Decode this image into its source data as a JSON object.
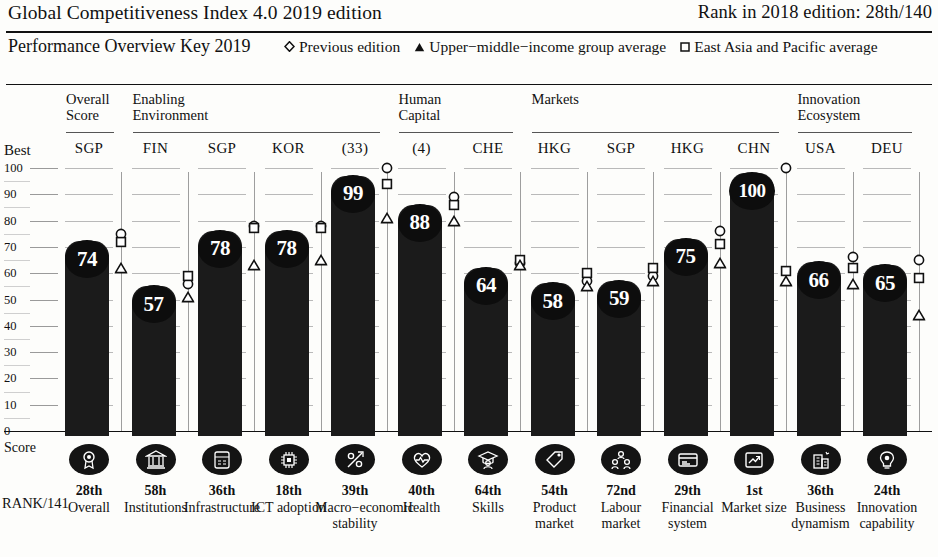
{
  "header": {
    "title": "Global Competitiveness Index 4.0 2019 edition",
    "rank": "Rank in 2018 edition: 28th/140"
  },
  "key": {
    "label": "Performance Overview Key 2019",
    "legend": [
      {
        "symbol": "diamond-marker",
        "label": "Previous edition"
      },
      {
        "symbol": "triangle-marker",
        "label": "Upper−middle−income group average"
      },
      {
        "symbol": "square-marker",
        "label": "East Asia and Pacific average"
      }
    ]
  },
  "axis": {
    "best_label": "Best",
    "score_label": "Score",
    "rank_label": "RANK/141",
    "ticks": [
      "100",
      "90",
      "80",
      "70",
      "60",
      "50",
      "40",
      "30",
      "20",
      "10",
      "0"
    ],
    "min": 0,
    "max": 100
  },
  "groups": [
    {
      "name": "Overall\nScore",
      "line1": "Overall",
      "line2": "Score"
    },
    {
      "name": "Enabling Environment",
      "line1": "Enabling",
      "line2": "Environment"
    },
    {
      "name": "Human Capital",
      "line1": "Human",
      "line2": "Capital"
    },
    {
      "name": "Markets",
      "line1": "Markets",
      "line2": ""
    },
    {
      "name": "Innovation Ecosystem",
      "line1": "Innovation",
      "line2": "Ecosystem"
    }
  ],
  "chart_data": {
    "type": "bar",
    "ylabel": "Score",
    "ylim": [
      0,
      100
    ],
    "grid": true,
    "categories": [
      "Overall",
      "Institutions",
      "Infrastructure",
      "ICT adoption",
      "Macro−economic stability",
      "Health",
      "Skills",
      "Product market",
      "Labour market",
      "Financial system",
      "Market size",
      "Business dynamism",
      "Innovation capability"
    ],
    "values": [
      74,
      57,
      78,
      78,
      99,
      88,
      64,
      58,
      59,
      75,
      100,
      66,
      65
    ],
    "series": [
      {
        "name": "2019 edition",
        "values": [
          74,
          57,
          78,
          78,
          99,
          88,
          64,
          58,
          59,
          75,
          100,
          66,
          65
        ]
      },
      {
        "name": "Previous edition",
        "values": [
          75,
          56,
          78,
          78,
          100,
          89,
          64,
          57,
          59,
          76,
          100,
          66,
          65
        ]
      },
      {
        "name": "East Asia and Pacific average",
        "values": [
          72,
          59,
          75,
          77,
          94,
          86,
          65,
          60,
          62,
          71,
          61,
          62,
          58
        ]
      },
      {
        "name": "Upper−middle−income group average",
        "values": [
          62,
          51,
          63,
          65,
          81,
          80,
          63,
          55,
          57,
          64,
          57,
          56,
          44
        ]
      }
    ],
    "best_economies": [
      "SGP",
      "FIN",
      "SGP",
      "KOR",
      "(33)",
      "(4)",
      "CHE",
      "HKG",
      "SGP",
      "HKG",
      "CHN",
      "USA",
      "DEU"
    ]
  },
  "columns": [
    {
      "code": "SGP",
      "value": 74,
      "prev": 75,
      "eap": 72,
      "umi": 62,
      "rank": "28th",
      "name": "Overall",
      "icon": "award-icon"
    },
    {
      "code": "FIN",
      "value": 57,
      "prev": 56,
      "eap": 59,
      "umi": 51,
      "rank": "58h",
      "name": "Institutions",
      "icon": "institution-icon"
    },
    {
      "code": "SGP",
      "value": 78,
      "prev": 78,
      "eap": 77,
      "umi": 63,
      "rank": "36th",
      "name": "Infrastructure",
      "icon": "infrastructure-icon"
    },
    {
      "code": "KOR",
      "value": 78,
      "prev": 78,
      "eap": 77,
      "umi": 65,
      "rank": "18th",
      "name": "ICT adoption",
      "icon": "chip-icon"
    },
    {
      "code": "(33)",
      "value": 99,
      "prev": 100,
      "eap": 94,
      "umi": 81,
      "rank": "39th",
      "name": "Macro−economic stability",
      "icon": "percent-icon"
    },
    {
      "code": "(4)",
      "value": 88,
      "prev": 89,
      "eap": 86,
      "umi": 80,
      "rank": "40th",
      "name": "Health",
      "icon": "heart-icon"
    },
    {
      "code": "CHE",
      "value": 64,
      "prev": 64,
      "eap": 65,
      "umi": 63,
      "rank": "64th",
      "name": "Skills",
      "icon": "graduate-icon"
    },
    {
      "code": "HKG",
      "value": 58,
      "prev": 57,
      "eap": 60,
      "umi": 55,
      "rank": "54th",
      "name": "Product market",
      "icon": "tag-icon"
    },
    {
      "code": "SGP",
      "value": 59,
      "prev": 59,
      "eap": 62,
      "umi": 57,
      "rank": "72nd",
      "name": "Labour market",
      "icon": "people-icon"
    },
    {
      "code": "HKG",
      "value": 75,
      "prev": 76,
      "eap": 71,
      "umi": 64,
      "rank": "29th",
      "name": "Financial system",
      "icon": "card-icon"
    },
    {
      "code": "CHN",
      "value": 100,
      "prev": 100,
      "eap": 61,
      "umi": 57,
      "rank": "1st",
      "name": "Market size",
      "icon": "growth-icon"
    },
    {
      "code": "USA",
      "value": 66,
      "prev": 66,
      "eap": 62,
      "umi": 56,
      "rank": "36th",
      "name": "Business dynamism",
      "icon": "factory-icon"
    },
    {
      "code": "DEU",
      "value": 65,
      "prev": 65,
      "eap": 58,
      "umi": 44,
      "rank": "24th",
      "name": "Innovation capability",
      "icon": "bulb-icon"
    }
  ]
}
